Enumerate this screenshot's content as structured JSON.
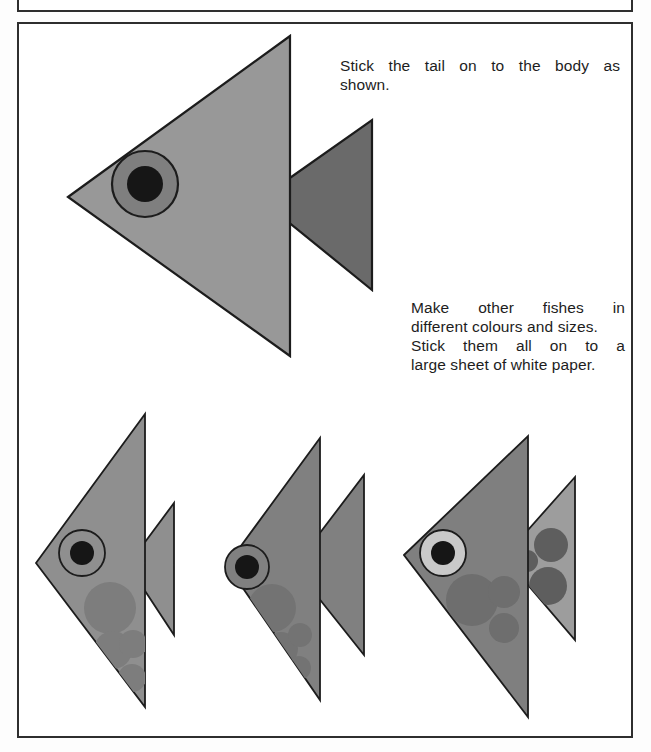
{
  "page": {
    "title": "Stick the tail on to the body as shown.",
    "background_color": "#ffffff",
    "frame_color": "#2e2e2e",
    "width": 651,
    "height": 752
  },
  "captions": [
    {
      "id": "caption-1",
      "lines": [
        "Stick the tail on to the body as",
        "shown."
      ],
      "line1": "Stick the tail on to the body as",
      "line2": "shown."
    },
    {
      "id": "caption-2",
      "lines": [
        "Make other fishes in",
        "different colours and sizes.",
        "Stick them all on to a",
        "large sheet of white paper."
      ],
      "line1": "Make other fishes in",
      "line2": "different colours and sizes.",
      "line3": "Stick them all on to a",
      "line4": "large sheet of white paper."
    }
  ],
  "colors": {
    "body_light": "#989898",
    "body_mid": "#8f8f8f",
    "body_dark": "#6f6f6f",
    "tail_dark": "#6a6a6a",
    "tail_light": "#9d9d9d",
    "spot": "#7d7d7d",
    "spot_dark": "#5e5e5e",
    "eye_ring": "#7f7f7f",
    "eye_ring_light": "#c9c9c9",
    "pupil": "#161616",
    "outline": "#1c1c1c"
  },
  "figures": [
    {
      "name": "large-fish",
      "label": "Large demonstration fish",
      "body_color": "#989898",
      "tail_color": "#6a6a6a",
      "eye_ring_color": "#7f7f7f",
      "pupil_color": "#161616",
      "body_points": "68,197 290,36 290,356",
      "tail_points": "260,199 372,120 372,290",
      "eye": {
        "cx": 145,
        "cy": 184,
        "r_outer": 33,
        "r_pupil": 18
      },
      "spots": []
    },
    {
      "name": "small-fish-1",
      "label": "Small fish one",
      "body_color": "#8f8f8f",
      "tail_color": "#8f8f8f",
      "eye_ring_color": "#8f8f8f",
      "pupil_color": "#161616",
      "body_points": "36,563 145,414 145,707",
      "tail_points": "128,565 174,503 174,635",
      "eye": {
        "cx": 82,
        "cy": 553,
        "r_outer": 23,
        "r_pupil": 12
      },
      "spots": [
        {
          "cx": 110,
          "cy": 608,
          "r": 26
        },
        {
          "cx": 113,
          "cy": 650,
          "r": 19
        },
        {
          "cx": 133,
          "cy": 644,
          "r": 14
        },
        {
          "cx": 132,
          "cy": 678,
          "r": 14
        }
      ]
    },
    {
      "name": "small-fish-2",
      "label": "Small fish two",
      "body_color": "#808080",
      "tail_color": "#808080",
      "eye_ring_color": "#808080",
      "pupil_color": "#161616",
      "body_points": "227,565 320,438 320,700",
      "tail_points": "294,567 364,475 364,655",
      "eye": {
        "cx": 247,
        "cy": 567,
        "r_outer": 22,
        "r_pupil": 12
      },
      "spots": [
        {
          "cx": 272,
          "cy": 608,
          "r": 24
        },
        {
          "cx": 281,
          "cy": 649,
          "r": 17
        },
        {
          "cx": 300,
          "cy": 635,
          "r": 12
        },
        {
          "cx": 299,
          "cy": 668,
          "r": 12
        }
      ]
    },
    {
      "name": "small-fish-3",
      "label": "Small fish three",
      "body_color": "#7f7f7f",
      "tail_color": "#9d9d9d",
      "eye_ring_color": "#c9c9c9",
      "pupil_color": "#161616",
      "body_points": "404,555 528,436 528,717",
      "tail_points": "504,557 575,477 575,640",
      "eye": {
        "cx": 443,
        "cy": 553,
        "r_outer": 23,
        "r_pupil": 12
      },
      "spots": [
        {
          "cx": 472,
          "cy": 600,
          "r": 26
        },
        {
          "cx": 504,
          "cy": 592,
          "r": 16
        },
        {
          "cx": 504,
          "cy": 628,
          "r": 15
        }
      ],
      "tail_spots": [
        {
          "cx": 527,
          "cy": 561,
          "r": 11
        },
        {
          "cx": 551,
          "cy": 545,
          "r": 17
        },
        {
          "cx": 548,
          "cy": 586,
          "r": 19
        }
      ]
    }
  ]
}
